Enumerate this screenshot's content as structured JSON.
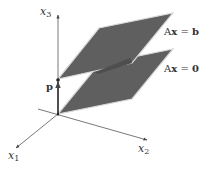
{
  "diagram": {
    "colors": {
      "plane_fill": "#5f5f5f",
      "plane_edge": "#d8d8d8",
      "axis": "#444444",
      "text": "#333333",
      "background": "#ffffff"
    },
    "axes": {
      "x1": {
        "var": "x",
        "sub": "1"
      },
      "x2": {
        "var": "x",
        "sub": "2"
      },
      "x3": {
        "var": "x",
        "sub": "3"
      }
    },
    "planes": [
      {
        "id": "upper",
        "eq_left": "A",
        "eq_var": "x",
        "eq_op": " = ",
        "eq_right": "b"
      },
      {
        "id": "lower",
        "eq_left": "A",
        "eq_var": "x",
        "eq_op": " = ",
        "eq_right": "0"
      }
    ],
    "point": {
      "label": "p"
    }
  }
}
